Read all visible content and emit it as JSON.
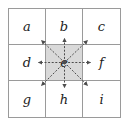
{
  "diagram": {
    "type": "grid-neighborhood",
    "rows": 3,
    "columns": 3,
    "cells": [
      {
        "id": "a",
        "label": "a",
        "row": 1,
        "col": 1,
        "shaded": false
      },
      {
        "id": "b",
        "label": "b",
        "row": 1,
        "col": 2,
        "shaded": false
      },
      {
        "id": "c",
        "label": "c",
        "row": 1,
        "col": 3,
        "shaded": false
      },
      {
        "id": "d",
        "label": "d",
        "row": 2,
        "col": 1,
        "shaded": false
      },
      {
        "id": "e",
        "label": "e",
        "row": 2,
        "col": 2,
        "shaded": true
      },
      {
        "id": "f",
        "label": "f",
        "row": 2,
        "col": 3,
        "shaded": false
      },
      {
        "id": "g",
        "label": "g",
        "row": 3,
        "col": 1,
        "shaded": false
      },
      {
        "id": "h",
        "label": "h",
        "row": 3,
        "col": 2,
        "shaded": false
      },
      {
        "id": "i",
        "label": "i",
        "row": 3,
        "col": 3,
        "shaded": false
      }
    ],
    "center_cell": "e",
    "arrows": [
      {
        "from": "e",
        "to": "a",
        "direction": "up-left",
        "style": "dashed"
      },
      {
        "from": "e",
        "to": "b",
        "direction": "up",
        "style": "dashed"
      },
      {
        "from": "e",
        "to": "c",
        "direction": "up-right",
        "style": "dashed"
      },
      {
        "from": "e",
        "to": "d",
        "direction": "left",
        "style": "dashed"
      },
      {
        "from": "e",
        "to": "f",
        "direction": "right",
        "style": "dashed"
      },
      {
        "from": "e",
        "to": "g",
        "direction": "down-left",
        "style": "dashed"
      },
      {
        "from": "e",
        "to": "h",
        "direction": "down",
        "style": "dashed"
      },
      {
        "from": "e",
        "to": "i",
        "direction": "down-right",
        "style": "dashed"
      }
    ],
    "colors": {
      "background": "#ffffff",
      "grid_line": "#9a9a9a",
      "center_fill": "#d9d9d9",
      "label_text": "#1c1c1c",
      "arrow": "#4d4d4d"
    }
  }
}
